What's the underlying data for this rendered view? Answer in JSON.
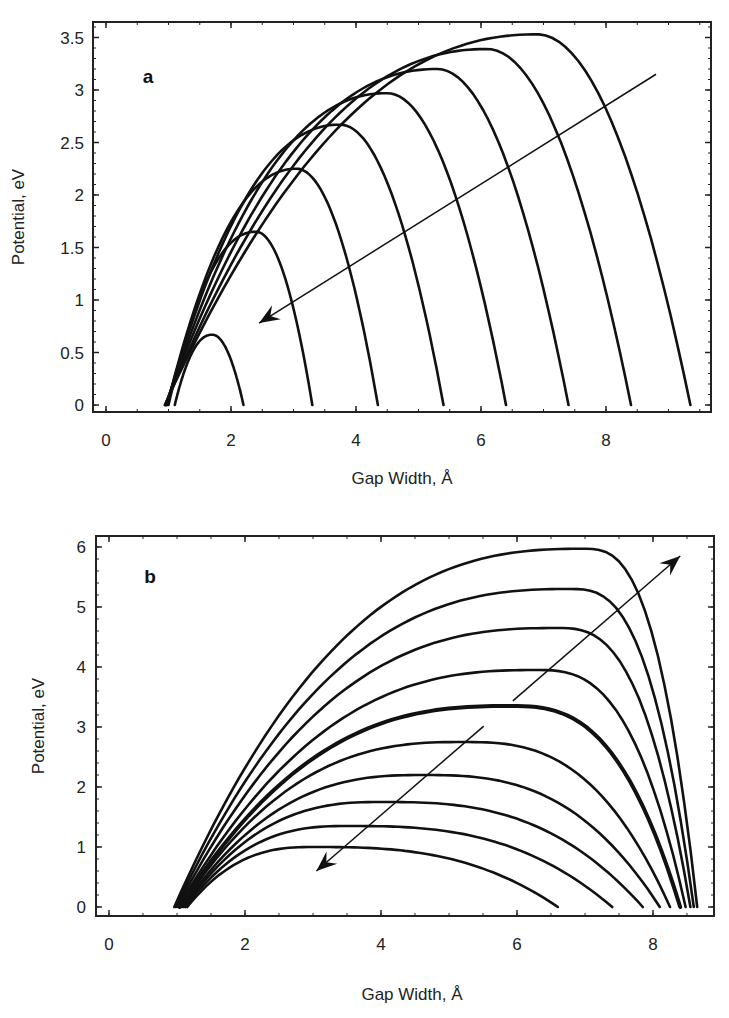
{
  "chart_data": [
    {
      "panel": "a",
      "type": "line",
      "panel_label": "a",
      "title": "",
      "xlabel": "Gap Width, Å",
      "ylabel": "Potential, eV",
      "xlim": [
        -0.25,
        9.7
      ],
      "ylim": [
        -0.1,
        3.65
      ],
      "xticks": [
        0,
        2,
        4,
        6,
        8
      ],
      "yticks": [
        0,
        0.5,
        1,
        1.5,
        2,
        2.5,
        3,
        3.5
      ],
      "ytick_labels": [
        "0",
        "0.5",
        "1",
        "1.5",
        "2",
        "2.5",
        "3",
        "3.5"
      ],
      "grid": false,
      "legend": null,
      "annotation": {
        "type": "arrow",
        "from": [
          8.8,
          3.15
        ],
        "to": [
          2.45,
          0.78
        ],
        "direction": "toward lower-left"
      },
      "series": [
        {
          "name": "curve 1",
          "x_start": 1.1,
          "x_end": 2.2,
          "peak_x": 1.7,
          "peak_y": 0.67
        },
        {
          "name": "curve 2",
          "x_start": 1.0,
          "x_end": 3.3,
          "peak_x": 2.4,
          "peak_y": 1.65
        },
        {
          "name": "curve 3",
          "x_start": 0.98,
          "x_end": 4.35,
          "peak_x": 3.05,
          "peak_y": 2.25
        },
        {
          "name": "curve 4",
          "x_start": 0.97,
          "x_end": 5.4,
          "peak_x": 3.75,
          "peak_y": 2.67
        },
        {
          "name": "curve 5",
          "x_start": 0.96,
          "x_end": 6.4,
          "peak_x": 4.5,
          "peak_y": 2.97
        },
        {
          "name": "curve 6",
          "x_start": 0.95,
          "x_end": 7.4,
          "peak_x": 5.3,
          "peak_y": 3.2
        },
        {
          "name": "curve 7",
          "x_start": 0.95,
          "x_end": 8.4,
          "peak_x": 6.1,
          "peak_y": 3.39
        },
        {
          "name": "curve 8",
          "x_start": 0.94,
          "x_end": 9.35,
          "peak_x": 6.9,
          "peak_y": 3.53
        }
      ]
    },
    {
      "panel": "b",
      "type": "line",
      "panel_label": "b",
      "title": "",
      "xlabel": "Gap Width, Å",
      "ylabel": "Potential, eV",
      "xlim": [
        -0.2,
        8.95
      ],
      "ylim": [
        -0.15,
        6.15
      ],
      "xticks": [
        0,
        2,
        4,
        6,
        8
      ],
      "yticks": [
        0,
        1,
        2,
        3,
        4,
        5,
        6
      ],
      "ytick_labels": [
        "0",
        "1",
        "2",
        "3",
        "4",
        "5",
        "6"
      ],
      "grid": false,
      "legend": null,
      "annotation": {
        "type": "double-arrow",
        "from": [
          3.05,
          0.6
        ],
        "to": [
          8.4,
          5.85
        ],
        "direction": "both ends, gap in the middle"
      },
      "series": [
        {
          "name": "curve 1",
          "x_start": 1.15,
          "x_end": 6.6,
          "peak_x": 3.0,
          "peak_y": 1.0
        },
        {
          "name": "curve 2",
          "x_start": 1.12,
          "x_end": 7.4,
          "peak_x": 3.5,
          "peak_y": 1.35
        },
        {
          "name": "curve 3",
          "x_start": 1.1,
          "x_end": 7.85,
          "peak_x": 4.0,
          "peak_y": 1.75
        },
        {
          "name": "curve 4",
          "x_start": 1.08,
          "x_end": 8.1,
          "peak_x": 4.6,
          "peak_y": 2.2
        },
        {
          "name": "curve 5",
          "x_start": 1.06,
          "x_end": 8.25,
          "peak_x": 5.2,
          "peak_y": 2.75
        },
        {
          "name": "curve 6 (bold)",
          "x_start": 1.04,
          "x_end": 8.4,
          "peak_x": 5.9,
          "peak_y": 3.35,
          "bold": true
        },
        {
          "name": "curve 7",
          "x_start": 1.02,
          "x_end": 8.48,
          "peak_x": 6.3,
          "peak_y": 3.95
        },
        {
          "name": "curve 8",
          "x_start": 1.0,
          "x_end": 8.55,
          "peak_x": 6.6,
          "peak_y": 4.65
        },
        {
          "name": "curve 9",
          "x_start": 0.98,
          "x_end": 8.6,
          "peak_x": 6.8,
          "peak_y": 5.3
        },
        {
          "name": "curve 10",
          "x_start": 0.96,
          "x_end": 8.65,
          "peak_x": 7.0,
          "peak_y": 5.97
        }
      ]
    }
  ]
}
